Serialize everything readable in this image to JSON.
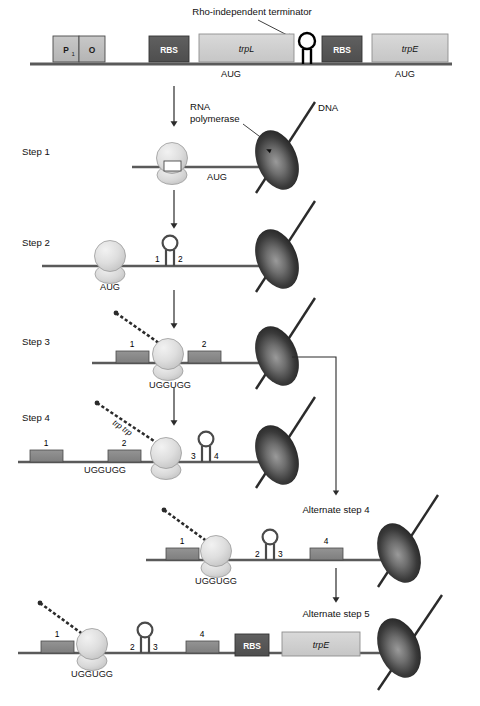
{
  "figure": {
    "colors": {
      "dna_line": "#5a5a5a",
      "rbs_box_fill": "#575757",
      "gene_box_fill": "#cfcfcf",
      "region_box_fill": "#8a8a8a",
      "promoter_box_fill": "#bdbdbd",
      "polymerase_dark": "#2b2b2b",
      "polymerase_light": "#8e8e8e",
      "ribosome_fill": "#dcdcdc",
      "arrow": "#2b2b2b",
      "text": "#111111"
    }
  },
  "annotations": {
    "terminator": "Rho-independent terminator",
    "rna_polymerase": "RNA\npolymerase",
    "rna_polymerase_line1": "RNA",
    "rna_polymerase_line2": "polymerase",
    "dna": "DNA",
    "trp_charged": "trp trp"
  },
  "operon_map": {
    "boxes": [
      {
        "label": "P",
        "subscript": "1",
        "type": "promoter"
      },
      {
        "label": "O",
        "type": "operator"
      },
      {
        "label": "RBS",
        "type": "rbs"
      },
      {
        "label": "trpL",
        "type": "gene"
      },
      {
        "label": "RBS",
        "type": "rbs"
      },
      {
        "label": "trpE",
        "type": "gene"
      }
    ],
    "start_codons": [
      "AUG",
      "AUG"
    ]
  },
  "steps": [
    {
      "id": "step-1",
      "label": "Step 1",
      "codon": "AUG",
      "regions": [],
      "hairpins": [],
      "has_ribosome": true,
      "has_polymerase": true,
      "has_peptide": false
    },
    {
      "id": "step-2",
      "label": "Step 2",
      "codon": "AUG",
      "regions": [],
      "hairpins": [
        {
          "left_number": "1",
          "right_number": "2"
        }
      ],
      "has_ribosome": true,
      "has_polymerase": true,
      "has_peptide": false
    },
    {
      "id": "step-3",
      "label": "Step 3",
      "codon": "UGGUGG",
      "regions": [
        {
          "number": "1"
        },
        {
          "number": "2"
        }
      ],
      "hairpins": [],
      "has_ribosome": true,
      "has_polymerase": true,
      "has_peptide": true
    },
    {
      "id": "step-4",
      "label": "Step 4",
      "codon": "UGGUGG",
      "regions": [
        {
          "number": "1"
        },
        {
          "number": "2"
        }
      ],
      "hairpins": [
        {
          "left_number": "3",
          "right_number": "4"
        }
      ],
      "has_ribosome": true,
      "has_polymerase": true,
      "has_peptide": true,
      "peptide_label": "trp trp"
    },
    {
      "id": "alternate-step-4",
      "label": "Alternate step 4",
      "codon": "UGGUGG",
      "regions": [
        {
          "number": "1"
        },
        {
          "number": "4"
        }
      ],
      "hairpins": [
        {
          "left_number": "2",
          "right_number": "3"
        }
      ],
      "has_ribosome": true,
      "has_polymerase": true,
      "has_peptide": true
    },
    {
      "id": "alternate-step-5",
      "label": "Alternate step 5",
      "codon": "UGGUGG",
      "regions": [
        {
          "number": "1"
        },
        {
          "number": "4"
        }
      ],
      "hairpins": [
        {
          "left_number": "2",
          "right_number": "3"
        }
      ],
      "downstream_boxes": [
        {
          "label": "RBS",
          "type": "rbs"
        },
        {
          "label": "trpE",
          "type": "gene"
        }
      ],
      "has_ribosome": true,
      "has_polymerase": true,
      "has_peptide": true
    }
  ],
  "step_labels": {
    "step1": "Step 1",
    "step2": "Step 2",
    "step3": "Step 3",
    "step4": "Step 4",
    "alt4": "Alternate step 4",
    "alt5": "Alternate step 5"
  },
  "codons": {
    "aug": "AUG",
    "ugguqq": "UGGUGG"
  },
  "numbers": {
    "n1": "1",
    "n2": "2",
    "n3": "3",
    "n4": "4"
  },
  "box_labels": {
    "rbs": "RBS",
    "trpL": "trpL",
    "trpE": "trpE",
    "promoter": "P",
    "promoter_sub": "1",
    "operator": "O"
  },
  "icons": {
    "down_arrow": "down-arrow-icon",
    "pointer": "arrow-pointer-icon",
    "hairpin": "rna-hairpin-icon",
    "ribosome": "ribosome-icon",
    "polymerase": "rna-polymerase-icon",
    "peptide": "polypeptide-chain-icon"
  }
}
